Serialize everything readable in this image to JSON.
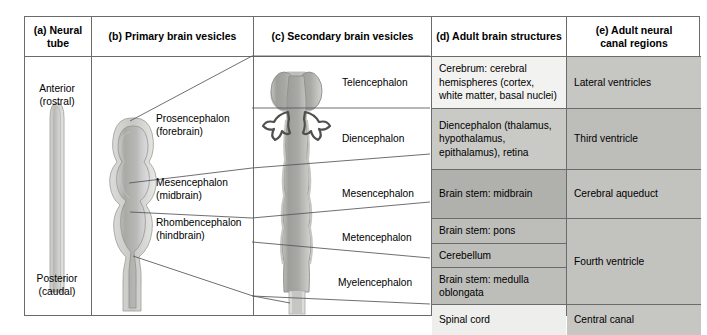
{
  "figure": {
    "background": "#ffffff",
    "border_color": "#6b6b6b"
  },
  "columns": [
    {
      "id": "a",
      "label": "(a) Neural\ntube",
      "label_line1": "(a) Neural",
      "label_line2": "tube"
    },
    {
      "id": "b",
      "label": "(b) Primary brain vesicles",
      "label_line1": "(b) Primary brain vesicles",
      "label_line2": ""
    },
    {
      "id": "c",
      "label": "(c) Secondary brain vesicles",
      "label_line1": "(c) Secondary brain vesicles",
      "label_line2": ""
    },
    {
      "id": "d",
      "label": "(d) Adult brain structures",
      "label_line1": "(d) Adult brain structures",
      "label_line2": ""
    },
    {
      "id": "e",
      "label": "(e) Adult neural\ncanal regions",
      "label_line1": "(e) Adult neural",
      "label_line2": "canal regions"
    }
  ],
  "neural_tube": {
    "anterior_line1": "Anterior",
    "anterior_line2": "(rostral)",
    "posterior_line1": "Posterior",
    "posterior_line2": "(caudal)"
  },
  "primary_vesicles": [
    {
      "name_line1": "Prosencephalon",
      "name_line2": "(forebrain)"
    },
    {
      "name_line1": "Mesencephalon",
      "name_line2": "(midbrain)"
    },
    {
      "name_line1": "Rhombencephalon",
      "name_line2": "(hindbrain)"
    }
  ],
  "secondary_vesicles": [
    {
      "name": "Telencephalon"
    },
    {
      "name": "Diencephalon"
    },
    {
      "name": "Mesencephalon"
    },
    {
      "name": "Metencephalon"
    },
    {
      "name": "Myelencephalon"
    }
  ],
  "adult_brain_structures": [
    {
      "text": "Cerebrum: cerebral hemispheres (cortex, white matter, basal nuclei)"
    },
    {
      "text": "Diencephalon (thalamus, hypothalamus, epithalamus), retina"
    },
    {
      "text": "Brain stem: midbrain"
    },
    {
      "text": "Brain stem: pons"
    },
    {
      "text": "Cerebellum"
    },
    {
      "text": "Brain stem: medulla oblongata"
    },
    {
      "text": "Spinal cord"
    }
  ],
  "adult_neural_canal_regions": [
    {
      "text": "Lateral ventricles"
    },
    {
      "text": "Third ventricle"
    },
    {
      "text": "Cerebral aqueduct"
    },
    {
      "text": "Fourth ventricle"
    },
    {
      "text": "Central canal"
    }
  ]
}
